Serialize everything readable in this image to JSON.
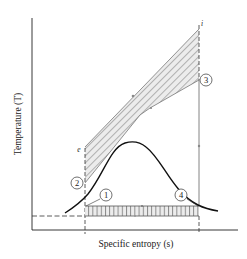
{
  "diagram": {
    "type": "T-s diagram (thermodynamic cycle with heat exchange)",
    "x_axis_label": "Specific entropy (s)",
    "y_axis_label": "Temperature (T)",
    "state_points": [
      {
        "id": "1",
        "label": "1"
      },
      {
        "id": "2",
        "label": "2"
      },
      {
        "id": "3",
        "label": "3"
      },
      {
        "id": "4",
        "label": "4"
      }
    ],
    "stream_labels": {
      "e": "e",
      "i": "i"
    },
    "colors": {
      "line": "#1a1a1a",
      "hatch": "#555555",
      "hatch_fill": "#e6e6e6",
      "dashed": "#333333"
    }
  }
}
